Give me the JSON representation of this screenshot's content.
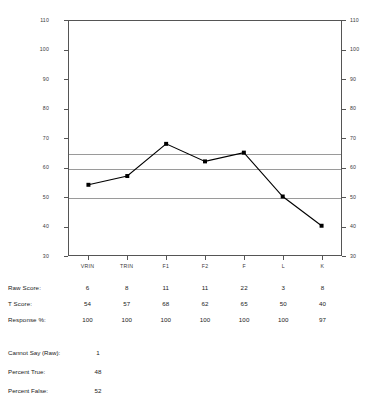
{
  "chart_data": {
    "type": "line",
    "title": "",
    "xlabel": "",
    "ylabel": "",
    "categories": [
      "VRIN",
      "TRIN",
      "F1",
      "F2",
      "F",
      "L",
      "K"
    ],
    "values": [
      54,
      57,
      68,
      62,
      65,
      50,
      40
    ],
    "series": [
      {
        "name": "T Score",
        "values": [
          54,
          57,
          68,
          62,
          65,
          50,
          40
        ]
      }
    ],
    "ylim": [
      30,
      110
    ],
    "yticks": [
      30,
      40,
      50,
      60,
      70,
      80,
      90,
      100,
      110
    ],
    "y_axis_left_labels": [
      "110",
      "100",
      "90",
      "80",
      "70",
      "60",
      "50",
      "40",
      "30"
    ],
    "y_axis_right_labels": [
      "110",
      "100",
      "90",
      "80",
      "70",
      "60",
      "50",
      "40",
      "30"
    ],
    "reference_lines": [
      65,
      60,
      50
    ],
    "grid": false,
    "legend": "none",
    "marker": "filled-square",
    "line_color": "#000000"
  },
  "table": {
    "row_labels": [
      "Raw Score:",
      "T Score:",
      "Response %:"
    ],
    "columns": [
      "VRIN",
      "TRIN",
      "F1",
      "F2",
      "F",
      "L",
      "K"
    ],
    "rows": [
      {
        "label": "Raw Score:",
        "values": [
          "6",
          "8",
          "11",
          "11",
          "22",
          "3",
          "8"
        ]
      },
      {
        "label": "T Score:",
        "values": [
          "54",
          "57",
          "68",
          "62",
          "65",
          "50",
          "40"
        ]
      },
      {
        "label": "Response %:",
        "values": [
          "100",
          "100",
          "100",
          "100",
          "100",
          "100",
          "97"
        ]
      }
    ]
  },
  "summary": {
    "items": [
      {
        "label": "Cannot Say (Raw):",
        "value": "1"
      },
      {
        "label": "Percent True:",
        "value": "48"
      },
      {
        "label": "Percent False:",
        "value": "52"
      }
    ]
  },
  "colors": {
    "line": "#000000",
    "axis": "#555555",
    "reference_line": "#9a9a9a",
    "text": "#1a1a1a",
    "background": "#ffffff"
  }
}
